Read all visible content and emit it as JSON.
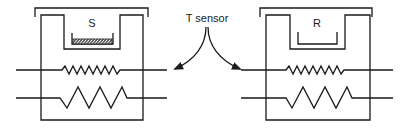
{
  "diagram": {
    "type": "DSC twin-cell schematic",
    "sensor_label": "T sensor",
    "cells": [
      {
        "id": "sample",
        "label": "S",
        "pan": "filled (hatched sample)"
      },
      {
        "id": "reference",
        "label": "R",
        "pan": "empty"
      }
    ],
    "elements": {
      "upper_wire": "small-amplitude resistor (sensor)",
      "lower_wire": "large-amplitude resistor (heater)"
    },
    "colors": {
      "line": "#1a1a1a",
      "background": "#ffffff"
    }
  }
}
